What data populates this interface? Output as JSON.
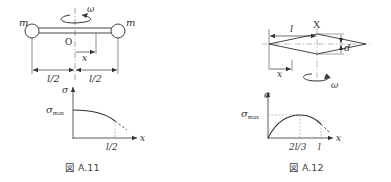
{
  "figure_left": {
    "caption": "図 A.11",
    "mass_left_label": "m",
    "mass_right_label": "m",
    "omega_label": "ω",
    "origin_label": "O",
    "x_label": "x",
    "half_length_left": "l/2",
    "half_length_right": "l/2",
    "graph": {
      "y_axis_label": "σ",
      "y_max_label": "σ",
      "y_max_subscript": "max",
      "x_axis_label": "x",
      "x_tick_label": "l/2"
    }
  },
  "figure_right": {
    "caption": "図 A.12",
    "length_label": "l",
    "section_label": "X",
    "thickness_label": "d",
    "x_label": "x",
    "omega_label": "ω",
    "graph": {
      "y_axis_label": "σ",
      "y_max_label": "σ",
      "y_max_subscript": "max",
      "x_axis_label": "x",
      "x_tick_peak_label": "2l/3",
      "x_tick_end_label": "l"
    }
  },
  "colors": {
    "line": "#444444",
    "dashed": "#888888",
    "background": "#ffffff"
  }
}
